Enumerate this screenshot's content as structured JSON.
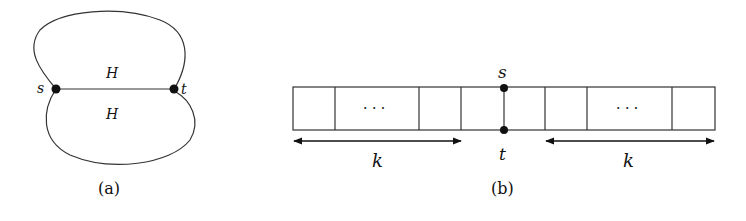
{
  "panel_a": {
    "caption": "(a)",
    "node_s_label": "s",
    "node_t_label": "t",
    "upper_region_label": "H",
    "lower_region_label": "H"
  },
  "panel_b": {
    "caption": "(b)",
    "node_s_label": "s",
    "node_t_label": "t",
    "left_ellipsis": "· · ·",
    "right_ellipsis": "· · ·",
    "left_span_label": "k",
    "right_span_label": "k"
  },
  "colors": {
    "stroke": "#222222",
    "node": "#111111",
    "background": "#ffffff"
  }
}
